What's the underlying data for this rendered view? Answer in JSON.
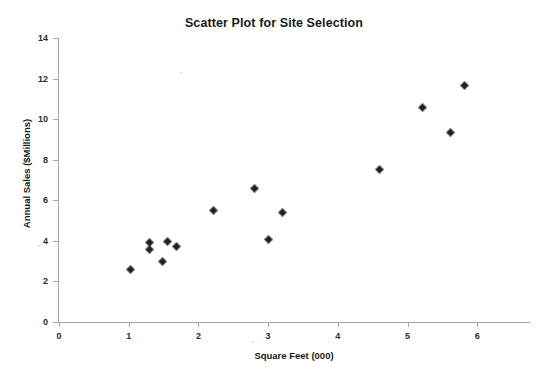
{
  "chart_data": {
    "type": "scatter",
    "title": "Scatter Plot for Site Selection",
    "xlabel": "Square Feet (000)",
    "ylabel": "Annual Sales ($Millions)",
    "xlim": [
      0,
      6.8
    ],
    "ylim": [
      0,
      14
    ],
    "xticks": [
      0,
      1,
      2,
      3,
      4,
      5,
      6
    ],
    "yticks": [
      0,
      2,
      4,
      6,
      8,
      10,
      12,
      14
    ],
    "xtick_labels": [
      "0",
      "1",
      "2",
      "3",
      "4",
      "5",
      "6"
    ],
    "ytick_labels": [
      "0",
      "2",
      "4",
      "6",
      "8",
      "10",
      "12",
      "14"
    ],
    "grid": false,
    "legend": false,
    "marker": "diamond",
    "marker_color": "#202020",
    "series": [
      {
        "name": "Sites",
        "points": [
          {
            "x": 1.03,
            "y": 2.6
          },
          {
            "x": 1.3,
            "y": 3.9
          },
          {
            "x": 1.3,
            "y": 3.55
          },
          {
            "x": 1.48,
            "y": 3.0
          },
          {
            "x": 1.56,
            "y": 3.95
          },
          {
            "x": 1.68,
            "y": 3.7
          },
          {
            "x": 2.21,
            "y": 5.5
          },
          {
            "x": 2.81,
            "y": 6.6
          },
          {
            "x": 3.01,
            "y": 4.05
          },
          {
            "x": 3.21,
            "y": 5.4
          },
          {
            "x": 4.6,
            "y": 7.5
          },
          {
            "x": 5.22,
            "y": 10.55
          },
          {
            "x": 5.61,
            "y": 9.35
          },
          {
            "x": 5.82,
            "y": 11.65
          }
        ]
      }
    ]
  }
}
